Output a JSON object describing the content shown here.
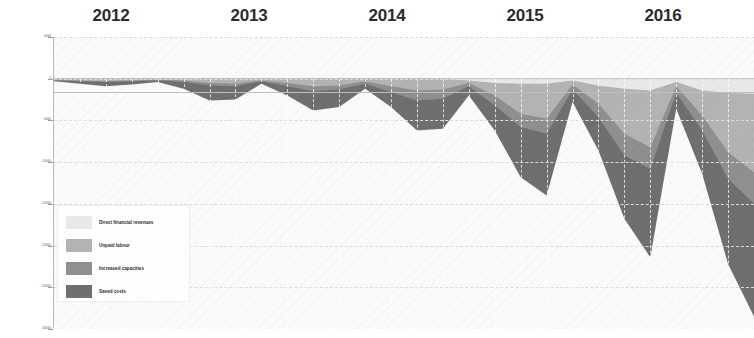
{
  "chart": {
    "type": "area",
    "stacked": true,
    "orientation": "downward",
    "title": "",
    "xlabel": "",
    "ylabel": "",
    "grid": true,
    "legend_position": "inside-bottom-left",
    "background": "#fafafa",
    "year_labels": [
      "2012",
      "2013",
      "2014",
      "2015",
      "2016"
    ],
    "y_axis": {
      "ticks": [
        50000,
        0,
        -50000,
        -100000,
        -150000,
        -200000,
        -250000,
        -300000
      ],
      "tick_labels": [
        "50000",
        "0",
        "-50000",
        "-100000",
        "-150000",
        "-200000",
        "-250000",
        "-300000"
      ],
      "ylim": [
        -300000,
        50000
      ]
    },
    "series": [
      {
        "name": "Direct financial revenues",
        "color": "#e8e8e8",
        "values": [
          0,
          0,
          0,
          0,
          0,
          0,
          0,
          0,
          0,
          0,
          0,
          0,
          0,
          0,
          0,
          0,
          -2000,
          -5000,
          -6000,
          -6000,
          -2000,
          -8000,
          -12000,
          -14000,
          -4000,
          -14000,
          -17000,
          -18000
        ]
      },
      {
        "name": "Unpaid labour",
        "color": "#b3b3b3",
        "values": [
          -1000,
          -2000,
          -3000,
          -2000,
          -1000,
          -2000,
          -5000,
          -6000,
          -2000,
          -5000,
          -9000,
          -8000,
          -3000,
          -9000,
          -14000,
          -13000,
          -5000,
          -20000,
          -42000,
          -48000,
          -7000,
          -30000,
          -66000,
          -82000,
          -9000,
          -44000,
          -88000,
          -112000
        ]
      },
      {
        "name": "Increased capacities",
        "color": "#8f8f8f",
        "values": [
          -2000,
          -3000,
          -4000,
          -3000,
          -2000,
          -4000,
          -8000,
          -9000,
          -3000,
          -9000,
          -15000,
          -13000,
          -6000,
          -16000,
          -26000,
          -24000,
          -9000,
          -32000,
          -58000,
          -66000,
          -13000,
          -46000,
          -92000,
          -108000,
          -17000,
          -62000,
          -120000,
          -150000
        ]
      },
      {
        "name": "Saved costs",
        "color": "#6f6f6f",
        "values": [
          -3000,
          -6000,
          -9000,
          -7000,
          -4000,
          -12000,
          -26000,
          -25000,
          -6000,
          -20000,
          -38000,
          -34000,
          -12000,
          -34000,
          -62000,
          -60000,
          -20000,
          -62000,
          -118000,
          -140000,
          -28000,
          -86000,
          -168000,
          -214000,
          -36000,
          -114000,
          -222000,
          -285000
        ]
      }
    ],
    "x_points": [
      "2012Q1",
      "2012Q2",
      "2012Q3",
      "2012Q4",
      "2013Q1",
      "2013Q2",
      "2013Q3",
      "2013Q4",
      "2014Q1",
      "2014Q2",
      "2014Q3",
      "2014Q4",
      "2015Q1",
      "2015Q2",
      "2015Q3",
      "2015Q4",
      "2016Q1",
      "2016Q2",
      "2016Q3",
      "2016Q4",
      "2017Q1",
      "2017Q2",
      "2017Q3",
      "2017Q4",
      "2018Q1",
      "2018Q2",
      "2018Q3",
      "2018Q4"
    ]
  },
  "legend": {
    "items": [
      {
        "label": "Direct financial revenues",
        "color": "#e8e8e8"
      },
      {
        "label": "Unpaid labour",
        "color": "#b3b3b3"
      },
      {
        "label": "Increased capacities",
        "color": "#8f8f8f"
      },
      {
        "label": "Saved costs",
        "color": "#6f6f6f"
      }
    ]
  }
}
